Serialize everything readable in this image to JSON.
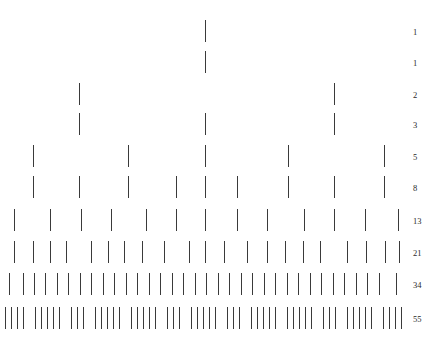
{
  "figure": {
    "width": 434,
    "height": 343,
    "background_color": "#ffffff",
    "tick_color": "#1a1a1a",
    "label_color": "#2a2a2a"
  },
  "chart_data": {
    "type": "bar",
    "title": "",
    "xlabel": "",
    "ylabel": "",
    "grid": false,
    "legend": "none",
    "categories": [
      "row-1",
      "row-2",
      "row-3",
      "row-4",
      "row-5",
      "row-6",
      "row-7",
      "row-8",
      "row-9",
      "row-10"
    ],
    "values": [
      1,
      1,
      2,
      3,
      5,
      8,
      13,
      21,
      34,
      55
    ],
    "tick_labels": [
      "1",
      "1",
      "2",
      "3",
      "5",
      "8",
      "13",
      "21",
      "34",
      "55"
    ],
    "rows": [
      {
        "index": 1,
        "count": 1,
        "label": "1",
        "y": 20,
        "positions": [
          205
        ]
      },
      {
        "index": 2,
        "count": 1,
        "label": "1",
        "y": 51,
        "positions": [
          205
        ]
      },
      {
        "index": 3,
        "count": 2,
        "label": "2",
        "y": 83,
        "positions": [
          79,
          334
        ]
      },
      {
        "index": 4,
        "count": 3,
        "label": "3",
        "y": 113,
        "positions": [
          79,
          205,
          334
        ]
      },
      {
        "index": 5,
        "count": 5,
        "label": "5",
        "y": 145,
        "positions": [
          33,
          128,
          205,
          288,
          384
        ]
      },
      {
        "index": 6,
        "count": 8,
        "label": "8",
        "y": 176,
        "positions": [
          33,
          79,
          128,
          176,
          205,
          237,
          288,
          334,
          384
        ]
      },
      {
        "index": 7,
        "count": 13,
        "label": "13",
        "y": 209,
        "positions": [
          14,
          50,
          81,
          111,
          146,
          176,
          205,
          237,
          267,
          304,
          334,
          365,
          398
        ]
      },
      {
        "index": 8,
        "count": 21,
        "label": "21",
        "y": 241,
        "positions": [
          14,
          33,
          50,
          66,
          91,
          108,
          124,
          142,
          164,
          189,
          205,
          224,
          247,
          267,
          285,
          303,
          320,
          347,
          366,
          385,
          399
        ]
      },
      {
        "index": 9,
        "count": 34,
        "label": "34",
        "y": 273,
        "positions": [
          9,
          23,
          34,
          45,
          57,
          68,
          80,
          91,
          103,
          114,
          126,
          137,
          149,
          160,
          172,
          183,
          195,
          206,
          218,
          229,
          241,
          252,
          264,
          275,
          287,
          298,
          310,
          321,
          333,
          344,
          356,
          367,
          379,
          396
        ]
      },
      {
        "index": 10,
        "count": 55,
        "label": "55",
        "y": 307,
        "positions": [
          5,
          11,
          17,
          23,
          35,
          41,
          47,
          53,
          59,
          71,
          77,
          83,
          95,
          101,
          107,
          113,
          119,
          131,
          137,
          143,
          149,
          155,
          167,
          173,
          179,
          191,
          197,
          203,
          209,
          215,
          227,
          233,
          239,
          251,
          257,
          263,
          269,
          275,
          287,
          293,
          299,
          305,
          311,
          323,
          329,
          335,
          347,
          353,
          359,
          365,
          371,
          383,
          389,
          395,
          401
        ]
      }
    ]
  },
  "labels": {
    "x": 413,
    "values": [
      "1",
      "1",
      "2",
      "3",
      "5",
      "8",
      "13",
      "21",
      "34",
      "55"
    ]
  },
  "caption": {
    "partial_text": "",
    "visible": false
  }
}
